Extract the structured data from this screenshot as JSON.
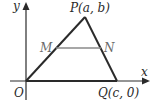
{
  "figure": {
    "type": "coordinate-geometry-triangle",
    "axes": {
      "x_label": "x",
      "y_label": "y",
      "origin_label": "O"
    },
    "points": {
      "P": "P(a, b)",
      "Q": "Q(c, 0)",
      "M": "M",
      "N": "N"
    },
    "colors": {
      "lines": "#2a2a2a",
      "midsegment": "#8a8a8a",
      "background": "#ffffff"
    }
  }
}
